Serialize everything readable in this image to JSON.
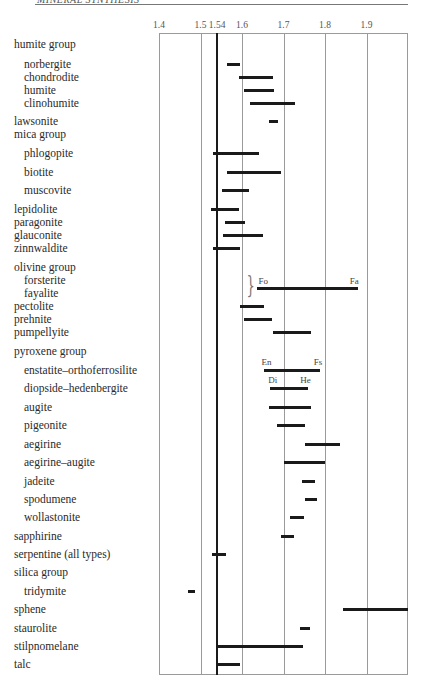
{
  "header": {
    "running_head": "MINERAL SYNTHESIS"
  },
  "chart_data": {
    "type": "range-bar",
    "title": "",
    "xlabel": "Refractive index",
    "ylabel": "",
    "xlim": [
      1.4,
      2.0
    ],
    "tick_labels": [
      "1.4",
      "1.5",
      "1.54",
      "1.6",
      "1.7",
      "1.8",
      "1.9"
    ],
    "tick_values": [
      1.4,
      1.5,
      1.54,
      1.6,
      1.7,
      1.8,
      1.9
    ],
    "reference_line": 1.54,
    "grid": true,
    "rows": [
      {
        "label": "humite group",
        "group": true,
        "y": 44
      },
      {
        "label": "norbergite",
        "indent": true,
        "y": 64,
        "min": 1.563,
        "max": 1.595
      },
      {
        "label": "chondrodite",
        "indent": true,
        "y": 77,
        "min": 1.592,
        "max": 1.675
      },
      {
        "label": "humite",
        "indent": true,
        "y": 90,
        "min": 1.604,
        "max": 1.677
      },
      {
        "label": "clinohumite",
        "indent": true,
        "y": 103,
        "min": 1.619,
        "max": 1.728
      },
      {
        "label": "lawsonite",
        "y": 121,
        "min": 1.665,
        "max": 1.686
      },
      {
        "label": "mica group",
        "group": true,
        "y": 134
      },
      {
        "label": "phlogopite",
        "indent": true,
        "y": 153,
        "min": 1.53,
        "max": 1.64
      },
      {
        "label": "biotite",
        "indent": true,
        "y": 172,
        "min": 1.565,
        "max": 1.695
      },
      {
        "label": "muscovite",
        "indent": true,
        "y": 190,
        "min": 1.552,
        "max": 1.618
      },
      {
        "label": "lepidolite",
        "y": 209,
        "min": 1.525,
        "max": 1.592
      },
      {
        "label": "paragonite",
        "y": 222,
        "min": 1.56,
        "max": 1.608
      },
      {
        "label": "glauconite",
        "y": 235,
        "min": 1.555,
        "max": 1.65
      },
      {
        "label": "zinnwaldite",
        "y": 248,
        "min": 1.53,
        "max": 1.595
      },
      {
        "label": "olivine group",
        "group": true,
        "y": 267
      },
      {
        "label": "forsterite",
        "indent": true,
        "y": 280
      },
      {
        "label": "fayalite",
        "indent": true,
        "y": 293
      },
      {
        "label": "pectolite",
        "y": 306,
        "min": 1.594,
        "max": 1.652
      },
      {
        "label": "prehnite",
        "y": 319,
        "min": 1.606,
        "max": 1.672
      },
      {
        "label": "pumpellyite",
        "y": 332,
        "min": 1.674,
        "max": 1.766
      },
      {
        "label": "pyroxene group",
        "group": true,
        "y": 351
      },
      {
        "label": "enstatite–orthoferrosilite",
        "indent": true,
        "y": 370,
        "min": 1.652,
        "max": 1.788,
        "start_label": "En",
        "end_label": "Fs"
      },
      {
        "label": "diopside–hedenbergite",
        "indent": true,
        "y": 388,
        "min": 1.667,
        "max": 1.758,
        "start_label": "Di",
        "end_label": "He"
      },
      {
        "label": "augite",
        "indent": true,
        "y": 407,
        "min": 1.665,
        "max": 1.766
      },
      {
        "label": "pigeonite",
        "indent": true,
        "y": 425,
        "min": 1.684,
        "max": 1.752
      },
      {
        "label": "aegirine",
        "indent": true,
        "y": 444,
        "min": 1.752,
        "max": 1.837
      },
      {
        "label": "aegirine–augite",
        "indent": true,
        "y": 462,
        "min": 1.7,
        "max": 1.8
      },
      {
        "label": "jadeite",
        "indent": true,
        "y": 481,
        "min": 1.744,
        "max": 1.776
      },
      {
        "label": "spodumene",
        "indent": true,
        "y": 499,
        "min": 1.752,
        "max": 1.781
      },
      {
        "label": "wollastonite",
        "indent": true,
        "y": 517,
        "min": 1.715,
        "max": 1.749
      },
      {
        "label": "sapphirine",
        "y": 536,
        "min": 1.693,
        "max": 1.725
      },
      {
        "label": "serpentine (all types)",
        "y": 554,
        "min": 1.528,
        "max": 1.562
      },
      {
        "label": "silica group",
        "group": true,
        "y": 572
      },
      {
        "label": "tridymite",
        "indent": true,
        "y": 591,
        "min": 1.47,
        "max": 1.487
      },
      {
        "label": "sphene",
        "y": 609,
        "min": 1.843,
        "max": 2.003
      },
      {
        "label": "staurolite",
        "y": 628,
        "min": 1.739,
        "max": 1.764
      },
      {
        "label": "stilpnomelane",
        "y": 646,
        "min": 1.54,
        "max": 1.748
      },
      {
        "label": "talc",
        "y": 664,
        "min": 1.54,
        "max": 1.596
      }
    ],
    "olivine_series": {
      "min": 1.637,
      "max": 1.88,
      "start_label": "Fo",
      "end_label": "Fa",
      "y": 287
    }
  }
}
